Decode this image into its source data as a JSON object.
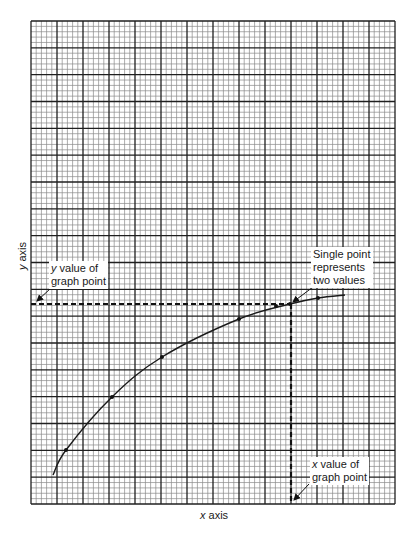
{
  "graph": {
    "grid": {
      "left": 31,
      "top": 21,
      "right": 395,
      "bottom": 504,
      "major_cols": 14,
      "major_rows": 18,
      "minor_per_major": 5,
      "major_color": "#1f1f1f",
      "minor_color": "#8a8a8a"
    },
    "axes": {
      "x_label_var": "x",
      "x_label_rest": " axis",
      "y_label_var": "y",
      "y_label_rest": " axis"
    },
    "curve": {
      "color": "#1a1a1a",
      "points": [
        [
          53,
          475
        ],
        [
          66,
          450
        ],
        [
          112,
          397
        ],
        [
          162,
          357
        ],
        [
          239,
          319
        ],
        [
          290,
          304
        ],
        [
          318,
          298
        ],
        [
          345,
          295
        ]
      ],
      "markers": [
        [
          66,
          450
        ],
        [
          112,
          397
        ],
        [
          162,
          357
        ],
        [
          239,
          319
        ],
        [
          276,
          306
        ],
        [
          290,
          304
        ],
        [
          318,
          298
        ]
      ]
    },
    "highlight_point": {
      "x": 291,
      "y": 304
    },
    "annotations": {
      "single_point": {
        "lines": [
          "Single point",
          "represents",
          "two values"
        ]
      },
      "y_value": {
        "var": "y",
        "line1_rest": " value of",
        "line2": "graph point"
      },
      "x_value": {
        "var": "x",
        "line1_rest": " value of",
        "line2": "graph point"
      }
    }
  }
}
